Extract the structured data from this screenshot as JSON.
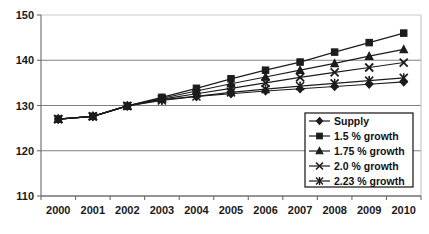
{
  "chart_data": {
    "type": "line",
    "title": "",
    "xlabel": "",
    "ylabel": "",
    "grid": true,
    "legend_position": "inside-bottom-right",
    "x": [
      2000,
      2001,
      2002,
      2003,
      2004,
      2005,
      2006,
      2007,
      2008,
      2009,
      2010
    ],
    "categories": [
      "2000",
      "2001",
      "2002",
      "2003",
      "2004",
      "2005",
      "2006",
      "2007",
      "2008",
      "2009",
      "2010"
    ],
    "xlim": [
      2000,
      2010
    ],
    "ylim": [
      110,
      150
    ],
    "yticks": [
      110,
      120,
      130,
      140,
      150
    ],
    "ytick_labels": [
      "110",
      "120",
      "130",
      "140",
      "150"
    ],
    "series": [
      {
        "name": "Supply",
        "marker": "diamond",
        "values": [
          127.0,
          127.6,
          129.9,
          131.3,
          132.0,
          132.6,
          133.2,
          133.7,
          134.2,
          134.7,
          135.2
        ]
      },
      {
        "name": "1.5 % growth",
        "marker": "square",
        "values": [
          127.0,
          127.6,
          129.9,
          131.8,
          133.8,
          135.9,
          137.8,
          139.6,
          141.8,
          143.9,
          146.0
        ]
      },
      {
        "name": "1.75 % growth",
        "marker": "triangle",
        "values": [
          127.0,
          127.6,
          129.9,
          131.6,
          133.2,
          134.8,
          136.3,
          137.8,
          139.3,
          140.9,
          142.4
        ]
      },
      {
        "name": "2.0 % growth",
        "marker": "cross",
        "values": [
          127.0,
          127.6,
          129.9,
          131.4,
          132.6,
          133.8,
          135.0,
          136.2,
          137.3,
          138.4,
          139.5
        ]
      },
      {
        "name": "2.23 % growth",
        "marker": "asterisk",
        "values": [
          127.0,
          127.6,
          129.9,
          131.1,
          132.0,
          132.9,
          133.6,
          134.3,
          134.9,
          135.5,
          136.1
        ]
      }
    ]
  },
  "legend": {
    "items": [
      {
        "label": "Supply"
      },
      {
        "label": "1.5 % growth"
      },
      {
        "label": "1.75 % growth"
      },
      {
        "label": "2.0 % growth"
      },
      {
        "label": "2.23 % growth"
      }
    ]
  }
}
